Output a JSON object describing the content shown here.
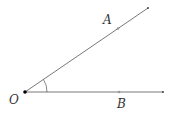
{
  "diagram": {
    "type": "angle",
    "vertex": {
      "label": "O",
      "x": 25,
      "y": 92
    },
    "rays": [
      {
        "name": "OA",
        "end": {
          "x": 148,
          "y": 8
        },
        "point": {
          "label": "A",
          "x": 118,
          "y": 28.5
        }
      },
      {
        "name": "OB",
        "end": {
          "x": 163,
          "y": 92
        },
        "point": {
          "label": "B",
          "x": 119,
          "y": 92
        }
      }
    ],
    "angle_mark": "arc",
    "colors": {
      "line": "#555555",
      "point": "#999999",
      "vertex": "#000000"
    }
  }
}
